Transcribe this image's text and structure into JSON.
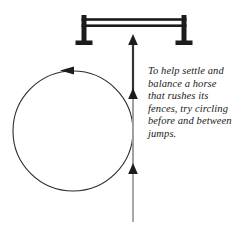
{
  "figure": {
    "title": "Circling before and between jumps",
    "caption": "To help settle and balance a horse that rushes its fences, try circling before and between jumps.",
    "background_color": "#ffffff"
  },
  "jump": {
    "label": "jump-fence",
    "color": "#1c1c1c",
    "left_post": {
      "x": 84,
      "y_top": 15,
      "y_bottom": 45
    },
    "right_post": {
      "x": 184,
      "y_top": 15,
      "y_bottom": 45
    },
    "rails": [
      {
        "name": "top-rail",
        "y": 20
      },
      {
        "name": "bottom-rail",
        "y": 27
      }
    ],
    "base_width": 17
  },
  "approach_line": {
    "label": "approach-path",
    "color": "#9a9a9a",
    "shaft_color": "#3a3a3a",
    "x": 133,
    "y_start": 222,
    "y_end": 36,
    "arrowheads": [
      {
        "name": "arrowhead-top",
        "y": 36
      },
      {
        "name": "arrowhead-middle",
        "y": 95
      },
      {
        "name": "arrowhead-bottom",
        "y": 170
      }
    ]
  },
  "circle": {
    "label": "circling-path",
    "color": "#2b2b2b",
    "center_x": 73,
    "center_y": 131,
    "radius": 60,
    "direction": "counterclockwise",
    "arrowhead": {
      "name": "circle-arrowhead",
      "x": 73,
      "y": 71,
      "points": "left"
    }
  }
}
